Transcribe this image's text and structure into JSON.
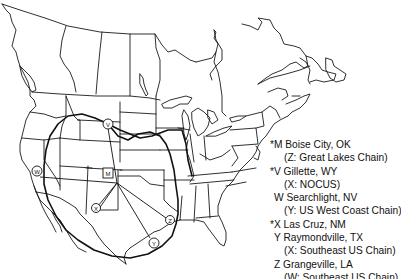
{
  "map": {
    "region": "North America (USA & Canada) outline map",
    "colors": {
      "line": "#1a1a1a",
      "background": "#ffffff"
    },
    "markers": [
      {
        "id": "M",
        "shape": "square",
        "label": "M",
        "x": 108,
        "y": 173
      },
      {
        "id": "V",
        "shape": "circle",
        "label": "V",
        "x": 108,
        "y": 124
      },
      {
        "id": "W",
        "shape": "circle",
        "label": "W",
        "x": 37,
        "y": 171
      },
      {
        "id": "X",
        "shape": "circle",
        "label": "X",
        "x": 96,
        "y": 208
      },
      {
        "id": "Y",
        "shape": "circle",
        "label": "Y",
        "x": 154,
        "y": 243
      },
      {
        "id": "Z",
        "shape": "circle",
        "label": "Z",
        "x": 170,
        "y": 220
      }
    ]
  },
  "legend": {
    "entries": [
      {
        "marker": "*M",
        "place": "Boise City, OK",
        "note": "(Z: Great Lakes Chain)"
      },
      {
        "marker": "*V",
        "place": "Gillette, WY",
        "note": "(X: NOCUS)"
      },
      {
        "marker": "W",
        "place": "Searchlight, NV",
        "note": "(Y: US West Coast Chain)"
      },
      {
        "marker": "*X",
        "place": "Las Cruz, NM",
        "note": ""
      },
      {
        "marker": "Y",
        "place": "Raymondville, TX",
        "note": "(X: Southeast US Chain)"
      },
      {
        "marker": "Z",
        "place": "Grangeville, LA",
        "note": "(W: Southeast US Chain)"
      }
    ],
    "lines": [
      "*M Boise City, OK",
      "(Z: Great Lakes Chain)",
      "*V Gillette, WY",
      "(X: NOCUS)",
      "W Searchlight, NV",
      "(Y: US West Coast Chain)",
      "*X Las Cruz, NM",
      "Y Raymondville, TX",
      "(X: Southeast US Chain)",
      "Z Grangeville, LA",
      "(W: Southeast US Chain)"
    ]
  }
}
